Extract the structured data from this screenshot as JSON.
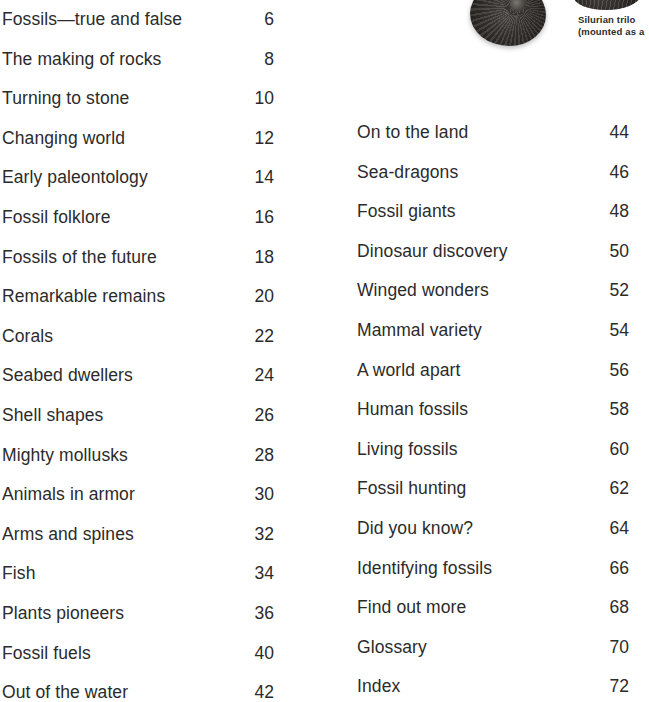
{
  "page": {
    "type": "book-table-of-contents",
    "background_color": "#ffffff",
    "text_color": "#2b2b2b"
  },
  "toc": {
    "left_column": [
      {
        "title": "Fossils—true and false",
        "page": "6"
      },
      {
        "title": "The making of rocks",
        "page": "8"
      },
      {
        "title": "Turning to stone",
        "page": "10"
      },
      {
        "title": "Changing world",
        "page": "12"
      },
      {
        "title": "Early paleontology",
        "page": "14"
      },
      {
        "title": "Fossil folklore",
        "page": "16"
      },
      {
        "title": "Fossils of the future",
        "page": "18"
      },
      {
        "title": "Remarkable remains",
        "page": "20"
      },
      {
        "title": "Corals",
        "page": "22"
      },
      {
        "title": "Seabed dwellers",
        "page": "24"
      },
      {
        "title": "Shell shapes",
        "page": "26"
      },
      {
        "title": "Mighty mollusks",
        "page": "28"
      },
      {
        "title": "Animals in armor",
        "page": "30"
      },
      {
        "title": "Arms and spines",
        "page": "32"
      },
      {
        "title": "Fish",
        "page": "34"
      },
      {
        "title": "Plants pioneers",
        "page": "36"
      },
      {
        "title": "Fossil fuels",
        "page": "40"
      },
      {
        "title": "Out of the water",
        "page": "42"
      }
    ],
    "right_column": [
      {
        "title": "On to the land",
        "page": "44"
      },
      {
        "title": "Sea-dragons",
        "page": "46"
      },
      {
        "title": "Fossil giants",
        "page": "48"
      },
      {
        "title": "Dinosaur discovery",
        "page": "50"
      },
      {
        "title": "Winged wonders",
        "page": "52"
      },
      {
        "title": "Mammal variety",
        "page": "54"
      },
      {
        "title": "A world apart",
        "page": "56"
      },
      {
        "title": "Human fossils",
        "page": "58"
      },
      {
        "title": "Living fossils",
        "page": "60"
      },
      {
        "title": "Fossil hunting",
        "page": "62"
      },
      {
        "title": "Did you know?",
        "page": "64"
      },
      {
        "title": "Identifying fossils",
        "page": "66"
      },
      {
        "title": "Find out more",
        "page": "68"
      },
      {
        "title": "Glossary",
        "page": "70"
      },
      {
        "title": "Index",
        "page": "72"
      }
    ]
  },
  "photos": {
    "ammonite": {
      "name": "ammonite-fossil-photo"
    },
    "trilobite": {
      "name": "trilobite-fossil-photo"
    },
    "caption": {
      "line1": "Silurian trilo",
      "line2": "(mounted as a "
    }
  }
}
